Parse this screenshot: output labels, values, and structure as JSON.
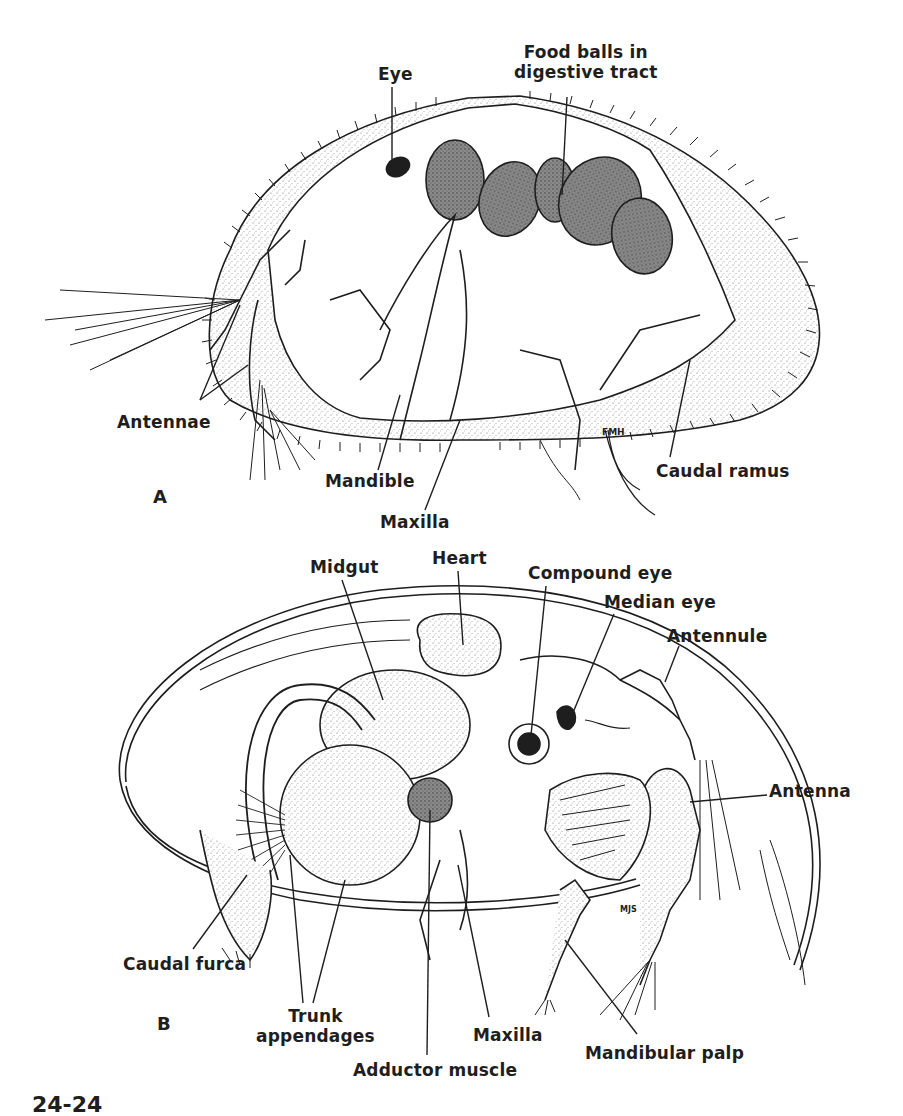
{
  "figure": {
    "caption_fragment": "24-24",
    "top_left_fragment": "",
    "panels": [
      {
        "id": "A",
        "label": "A",
        "labels": [
          {
            "key": "eye",
            "text": "Eye",
            "x": 378,
            "y": 64
          },
          {
            "key": "food_balls",
            "text": "Food balls in\ndigestive tract",
            "x": 514,
            "y": 42
          },
          {
            "key": "antennae",
            "text": "Antennae",
            "x": 117,
            "y": 412
          },
          {
            "key": "mandible",
            "text": "Mandible",
            "x": 325,
            "y": 471
          },
          {
            "key": "maxilla",
            "text": "Maxilla",
            "x": 380,
            "y": 512
          },
          {
            "key": "caudal_ramus",
            "text": "Caudal ramus",
            "x": 656,
            "y": 461
          }
        ]
      },
      {
        "id": "B",
        "label": "B",
        "labels": [
          {
            "key": "midgut",
            "text": "Midgut",
            "x": 310,
            "y": 557
          },
          {
            "key": "heart",
            "text": "Heart",
            "x": 432,
            "y": 548
          },
          {
            "key": "compound_eye",
            "text": "Compound eye",
            "x": 528,
            "y": 563
          },
          {
            "key": "median_eye",
            "text": "Median eye",
            "x": 604,
            "y": 592
          },
          {
            "key": "antennule",
            "text": "Antennule",
            "x": 667,
            "y": 626
          },
          {
            "key": "antenna",
            "text": "Antenna",
            "x": 769,
            "y": 781
          },
          {
            "key": "caudal_furca",
            "text": "Caudal furca",
            "x": 123,
            "y": 954
          },
          {
            "key": "trunk_appendages",
            "text": "Trunk\nappendages",
            "x": 256,
            "y": 1006
          },
          {
            "key": "adductor_muscle",
            "text": "Adductor muscle",
            "x": 353,
            "y": 1060
          },
          {
            "key": "maxilla_b",
            "text": "Maxilla",
            "x": 473,
            "y": 1025
          },
          {
            "key": "mandibular_palp",
            "text": "Mandibular palp",
            "x": 585,
            "y": 1043
          }
        ]
      }
    ],
    "artist_initials": [
      "FMH",
      "MJS"
    ],
    "colors": {
      "ink": "#1e1e1e",
      "stipple": "#9a9a9a",
      "food_ball": "#6e6e6e",
      "background": "#ffffff"
    }
  }
}
